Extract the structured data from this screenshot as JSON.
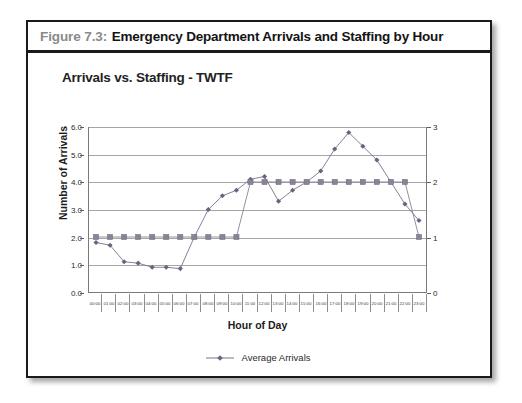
{
  "figure": {
    "caption_label": "Figure 7.3:",
    "caption_title": "Emergency Department Arrivals and Staffing by Hour"
  },
  "colors": {
    "series_arrivals": "#7b6f8e",
    "series_staffing": "#8a8296",
    "gridline": "#a6a6a6",
    "axis": "#7a7a7a",
    "text": "#222222",
    "caption_label": "#8a8a8a"
  },
  "chart_data": {
    "type": "line",
    "title": "Arrivals vs. Staffing - TWTF",
    "xlabel": "Hour of Day",
    "ylabel": "Number of Arrivals",
    "y2label": "",
    "grid": true,
    "legend_position": "bottom",
    "ylim": [
      0.0,
      6.0
    ],
    "yticks": [
      "0.0",
      "1.0",
      "2.0",
      "3.0",
      "4.0",
      "5.0",
      "6.0"
    ],
    "y2lim": [
      0,
      3
    ],
    "y2ticks": [
      "0",
      "1",
      "2",
      "3"
    ],
    "categories": [
      "00:00",
      "01:00",
      "02:00",
      "03:00",
      "04:00",
      "05:00",
      "06:00",
      "07:00",
      "08:00",
      "09:00",
      "10:00",
      "11:00",
      "12:00",
      "13:00",
      "14:00",
      "15:00",
      "16:00",
      "17:00",
      "18:00",
      "19:00",
      "20:00",
      "21:00",
      "22:00",
      "23:00"
    ],
    "series": [
      {
        "name": "Average Arrivals",
        "axis": "left",
        "marker": "diamond",
        "values": [
          1.8,
          1.7,
          1.1,
          1.05,
          0.9,
          0.9,
          0.85,
          2.0,
          3.0,
          3.5,
          3.7,
          4.1,
          4.2,
          3.3,
          3.7,
          4.0,
          4.4,
          5.2,
          5.8,
          5.3,
          4.8,
          4.0,
          3.2,
          2.6
        ]
      },
      {
        "name": "Staffing",
        "axis": "right",
        "marker": "square",
        "values": [
          1,
          1,
          1,
          1,
          1,
          1,
          1,
          1,
          1,
          1,
          1,
          2,
          2,
          2,
          2,
          2,
          2,
          2,
          2,
          2,
          2,
          2,
          2,
          1
        ]
      }
    ],
    "legend": [
      "Average Arrivals"
    ]
  }
}
